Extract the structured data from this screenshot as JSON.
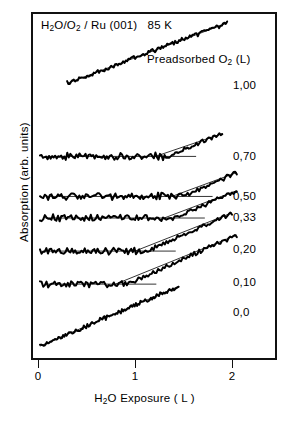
{
  "figure": {
    "title_html": "H<sub>2</sub>O/O<sub>2</sub> / Ru (001)&nbsp;&nbsp; 85 K",
    "title_text": "H2O/O2 / Ru (001)  85 K",
    "legend_title_html": "Preadsorbed O<sub>2</sub> (L)",
    "legend_title_text": "Preadsorbed O2 (L)",
    "xaxis_title_html": "H<sub>2</sub>O Exposure ( L )",
    "xaxis_title_text": "H2O Exposure ( L )",
    "yaxis_title_text": "Absorption (arb. units)",
    "line_color": "#000000",
    "frame_color": "#111111",
    "background": "#ffffff"
  },
  "chart_data": {
    "type": "line",
    "xlabel": "H2O Exposure ( L )",
    "ylabel": "Absorption (arb. units)",
    "legend_title": "Preadsorbed O2 (L)",
    "legend_position": "right",
    "grid": false,
    "xlim": [
      -0.08,
      2.45
    ],
    "ylim": [
      0,
      1
    ],
    "xticks": [
      0,
      1,
      2
    ],
    "xtick_labels": [
      "0",
      "1",
      "2"
    ],
    "yticks": [],
    "ytick_labels": [],
    "note": "Seven vertically offset uptake curves; each trace is flat (no uptake) until a threshold H2O exposure, then rises linearly. Threshold increases with preadsorbed O2 coverage. Thin straight guide lines are drawn over the flat and rising portions of each trace.",
    "series": [
      {
        "name": "1.00",
        "label": "1,00",
        "offset_y": 0.795,
        "knee_x": 0.3,
        "slope": 0.105,
        "x_start": 0.3,
        "x_end": 1.95,
        "x": [
          0.3,
          0.45,
          0.6,
          0.75,
          0.9,
          1.05,
          1.2,
          1.35,
          1.5,
          1.65,
          1.8,
          1.95
        ],
        "y": [
          0.0,
          0.016,
          0.032,
          0.047,
          0.063,
          0.079,
          0.095,
          0.11,
          0.126,
          0.142,
          0.158,
          0.173
        ]
      },
      {
        "name": "0.70",
        "label": "0,70",
        "offset_y": 0.585,
        "knee_x": 1.33,
        "slope": 0.115,
        "x_start": 0.02,
        "x_end": 1.9,
        "x": [
          0.02,
          0.3,
          0.6,
          0.9,
          1.2,
          1.33,
          1.5,
          1.7,
          1.9
        ],
        "y": [
          0.0,
          0.0,
          0.0,
          0.0,
          0.0,
          0.0,
          0.02,
          0.043,
          0.066
        ]
      },
      {
        "name": "0.50",
        "label": "0,50",
        "offset_y": 0.47,
        "knee_x": 1.5,
        "slope": 0.125,
        "x_start": 0.02,
        "x_end": 2.05,
        "x": [
          0.02,
          0.4,
          0.8,
          1.2,
          1.5,
          1.7,
          1.9,
          2.05
        ],
        "y": [
          0.0,
          0.0,
          0.0,
          0.0,
          0.0,
          0.025,
          0.05,
          0.069
        ]
      },
      {
        "name": "0.33",
        "label": "0,33",
        "offset_y": 0.408,
        "knee_x": 1.42,
        "slope": 0.125,
        "x_start": 0.02,
        "x_end": 2.05,
        "x": [
          0.02,
          0.4,
          0.8,
          1.1,
          1.42,
          1.65,
          1.85,
          2.05
        ],
        "y": [
          0.0,
          0.0,
          0.0,
          0.0,
          0.0,
          0.029,
          0.054,
          0.079
        ]
      },
      {
        "name": "0.20",
        "label": "0,20",
        "offset_y": 0.313,
        "knee_x": 1.12,
        "slope": 0.125,
        "x_start": 0.02,
        "x_end": 2.0,
        "x": [
          0.02,
          0.35,
          0.7,
          1.0,
          1.12,
          1.4,
          1.7,
          2.0
        ],
        "y": [
          0.0,
          0.0,
          0.0,
          0.0,
          0.0,
          0.035,
          0.072,
          0.11
        ]
      },
      {
        "name": "0.10",
        "label": "0,10",
        "offset_y": 0.218,
        "knee_x": 0.92,
        "slope": 0.125,
        "x_start": 0.02,
        "x_end": 2.05,
        "x": [
          0.02,
          0.3,
          0.6,
          0.8,
          0.92,
          1.25,
          1.6,
          2.05
        ],
        "y": [
          0.0,
          0.0,
          0.0,
          0.0,
          0.0,
          0.041,
          0.085,
          0.141
        ]
      },
      {
        "name": "0.0",
        "label": "0,0",
        "offset_y": 0.04,
        "knee_x": 0.02,
        "slope": 0.12,
        "x_start": 0.02,
        "x_end": 1.45,
        "x": [
          0.02,
          0.25,
          0.5,
          0.75,
          1.0,
          1.25,
          1.45
        ],
        "y": [
          0.0,
          0.028,
          0.058,
          0.088,
          0.118,
          0.148,
          0.172
        ]
      }
    ]
  },
  "xticks": [
    {
      "label": "0",
      "x_px": 38
    },
    {
      "label": "1",
      "x_px": 135
    },
    {
      "label": "2",
      "x_px": 232
    }
  ],
  "curve_labels": [
    {
      "label": "1,00",
      "left_px": 233,
      "top_px": 79
    },
    {
      "label": "0,70",
      "left_px": 233,
      "top_px": 150
    },
    {
      "label": "0,50",
      "left_px": 233,
      "top_px": 190
    },
    {
      "label": "0,33",
      "left_px": 233,
      "top_px": 211
    },
    {
      "label": "0,20",
      "left_px": 233,
      "top_px": 243
    },
    {
      "label": "0,10",
      "left_px": 233,
      "top_px": 276
    },
    {
      "label": "0,0",
      "left_px": 233,
      "top_px": 306
    }
  ]
}
